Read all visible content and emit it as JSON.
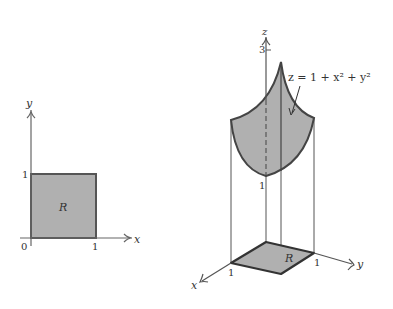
{
  "panel_2d": {
    "x_axis_label": "x",
    "y_axis_label": "y",
    "origin_label": "0",
    "x_tick": "1",
    "y_tick": "1",
    "region_label": "R"
  },
  "panel_3d": {
    "z_axis_label": "z",
    "x_axis_label": "x",
    "y_axis_label": "y",
    "z_tick_top": "3",
    "z_min_label": "1",
    "x_tick": "1",
    "y_tick": "1",
    "region_label": "R",
    "surface_equation": "z = 1 + x² + y²"
  },
  "colors": {
    "fill": "#b0b0b0",
    "stroke": "#444444",
    "axis": "#555555"
  }
}
